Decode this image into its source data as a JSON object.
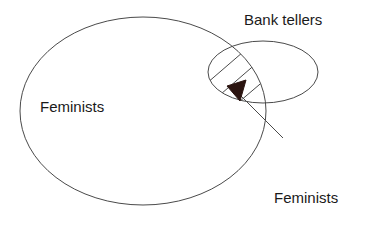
{
  "figure": {
    "type": "venn-diagram",
    "background_color": "#ffffff",
    "stroke_color": "#4a4a4a",
    "text_color": "#1a1a1a",
    "arrow_fill_color": "#2b1410"
  },
  "sets": {
    "large_ellipse": {
      "name": "Feminists",
      "cx": 143,
      "cy": 111,
      "rx": 123,
      "ry": 94
    },
    "small_ellipse": {
      "name": "Bank tellers",
      "cx": 263,
      "cy": 72,
      "rx": 55,
      "ry": 31
    },
    "intersection": {
      "name": "Feminists and bank tellers",
      "hatched": true,
      "hatch_line_count": 3
    }
  },
  "labels": {
    "feminists": "Feminists",
    "bank_tellers": "Bank tellers",
    "intersection_line1": "Feminists",
    "intersection_line2": "and bank",
    "intersection_line3": "tellers"
  },
  "annotations": {
    "leader_line": {
      "name": "callout-leader-line",
      "from_x": 283,
      "from_y": 138,
      "to_x": 234,
      "to_y": 89
    },
    "arrowhead": {
      "name": "callout-arrowhead",
      "points_to": "intersection",
      "tip_x": 228,
      "tip_y": 86
    }
  },
  "icons": {
    "arrowhead": "arrow-triangle-icon"
  }
}
